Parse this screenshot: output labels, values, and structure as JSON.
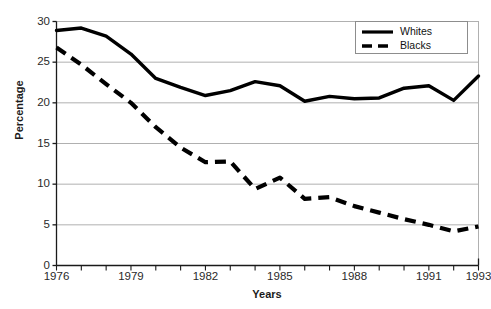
{
  "chart_data": {
    "type": "line",
    "title": "",
    "xlabel": "Years",
    "ylabel": "Percentage",
    "x": [
      1976,
      1977,
      1978,
      1979,
      1980,
      1981,
      1982,
      1983,
      1984,
      1985,
      1986,
      1987,
      1988,
      1989,
      1990,
      1991,
      1992,
      1993
    ],
    "categories": [
      "1976",
      "1977",
      "1978",
      "1979",
      "1980",
      "1981",
      "1982",
      "1983",
      "1984",
      "1985",
      "1986",
      "1987",
      "1988",
      "1989",
      "1990",
      "1991",
      "1992",
      "1993"
    ],
    "xlim": [
      1976,
      1993
    ],
    "ylim": [
      0,
      30
    ],
    "y_ticks": [
      0,
      5,
      10,
      15,
      20,
      25,
      30
    ],
    "y_tick_labels": [
      "0",
      "5",
      "10",
      "15",
      "20",
      "25",
      "30"
    ],
    "x_tick_labels_shown": [
      "1976",
      "1979",
      "1982",
      "1985",
      "1988",
      "1991",
      "1993"
    ],
    "grid": "horizontal",
    "legend_position": "top-right",
    "series": [
      {
        "name": "Whites",
        "style": "solid",
        "color": "#000000",
        "values": [
          28.9,
          29.2,
          28.2,
          26.0,
          23.0,
          21.9,
          20.9,
          21.5,
          22.6,
          22.1,
          20.2,
          20.8,
          20.5,
          20.6,
          21.8,
          22.1,
          20.3,
          23.3
        ]
      },
      {
        "name": "Blacks",
        "style": "dashed",
        "color": "#000000",
        "values": [
          26.8,
          24.7,
          22.3,
          20.0,
          17.0,
          14.5,
          12.7,
          12.8,
          9.4,
          10.8,
          8.2,
          8.4,
          7.3,
          6.5,
          5.7,
          5.0,
          4.2,
          4.8
        ]
      }
    ]
  },
  "axes": {
    "y_title": "Percentage",
    "x_title": "Years"
  },
  "legend": {
    "items": [
      {
        "label": "Whites",
        "icon": "solid-line-icon"
      },
      {
        "label": "Blacks",
        "icon": "dashed-line-icon"
      }
    ]
  }
}
